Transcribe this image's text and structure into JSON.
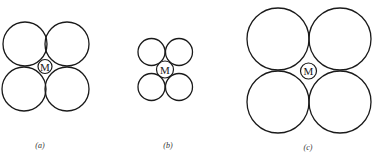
{
  "figure": {
    "panels": [
      {
        "id": "a",
        "caption": "(a)",
        "center_label": "M",
        "surrounding_count": 4,
        "relative_size": "medium"
      },
      {
        "id": "b",
        "caption": "(b)",
        "center_label": "M",
        "surrounding_count": 4,
        "relative_size": "small"
      },
      {
        "id": "c",
        "caption": "(c)",
        "center_label": "M",
        "surrounding_count": 4,
        "relative_size": "large"
      }
    ],
    "colors": {
      "stroke": "#1a1a1a",
      "background": "#ffffff"
    }
  }
}
